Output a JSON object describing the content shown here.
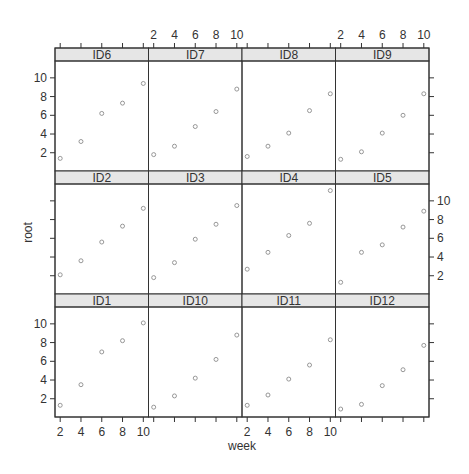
{
  "chart_data": {
    "type": "scatter",
    "layout": "trellis",
    "layout_grid": {
      "columns": 4,
      "rows": 3
    },
    "xlabel": "week",
    "ylabel": "root",
    "x_ticks": [
      2,
      4,
      6,
      8,
      10
    ],
    "y_ticks": [
      2,
      4,
      6,
      8,
      10
    ],
    "xlim": [
      1.5,
      10.5
    ],
    "ylim": [
      0.05,
      11.8
    ],
    "grid": false,
    "legend": null,
    "marker": "open-circle",
    "colors": {
      "strip_fill": "#e6e6e6",
      "panel_border": "#333333",
      "point_stroke": "#8c8c8c",
      "text": "#333333"
    },
    "x": [
      2,
      4,
      6,
      8,
      10
    ],
    "panels": [
      {
        "id": "ID6",
        "row": 0,
        "col": 0,
        "values": [
          1.4,
          3.2,
          6.2,
          7.3,
          9.4
        ]
      },
      {
        "id": "ID7",
        "row": 0,
        "col": 1,
        "values": [
          1.8,
          2.7,
          4.8,
          6.4,
          8.8
        ]
      },
      {
        "id": "ID8",
        "row": 0,
        "col": 2,
        "values": [
          1.6,
          2.7,
          4.1,
          6.5,
          8.3
        ]
      },
      {
        "id": "ID9",
        "row": 0,
        "col": 3,
        "values": [
          1.3,
          2.1,
          4.1,
          6.0,
          8.3
        ]
      },
      {
        "id": "ID2",
        "row": 1,
        "col": 0,
        "values": [
          2.1,
          3.6,
          5.6,
          7.3,
          9.2
        ]
      },
      {
        "id": "ID3",
        "row": 1,
        "col": 1,
        "values": [
          1.8,
          3.4,
          5.9,
          7.5,
          9.5
        ]
      },
      {
        "id": "ID4",
        "row": 1,
        "col": 2,
        "values": [
          2.7,
          4.5,
          6.3,
          7.6,
          11.1
        ]
      },
      {
        "id": "ID5",
        "row": 1,
        "col": 3,
        "values": [
          1.3,
          4.5,
          5.3,
          7.2,
          8.9
        ]
      },
      {
        "id": "ID1",
        "row": 2,
        "col": 0,
        "values": [
          1.3,
          3.5,
          7.0,
          8.2,
          10.1
        ]
      },
      {
        "id": "ID10",
        "row": 2,
        "col": 1,
        "values": [
          1.1,
          2.3,
          4.2,
          6.2,
          8.8
        ]
      },
      {
        "id": "ID11",
        "row": 2,
        "col": 2,
        "values": [
          1.3,
          2.4,
          4.1,
          5.6,
          8.3
        ]
      },
      {
        "id": "ID12",
        "row": 2,
        "col": 3,
        "values": [
          0.9,
          1.4,
          3.4,
          5.1,
          7.7
        ]
      }
    ],
    "axis_placement": {
      "x_labels_top_cols": [
        1,
        3
      ],
      "x_labels_bottom_cols": [
        0,
        2
      ],
      "y_labels_left_rows": [
        0,
        2
      ],
      "y_labels_right_rows": [
        1
      ]
    }
  }
}
